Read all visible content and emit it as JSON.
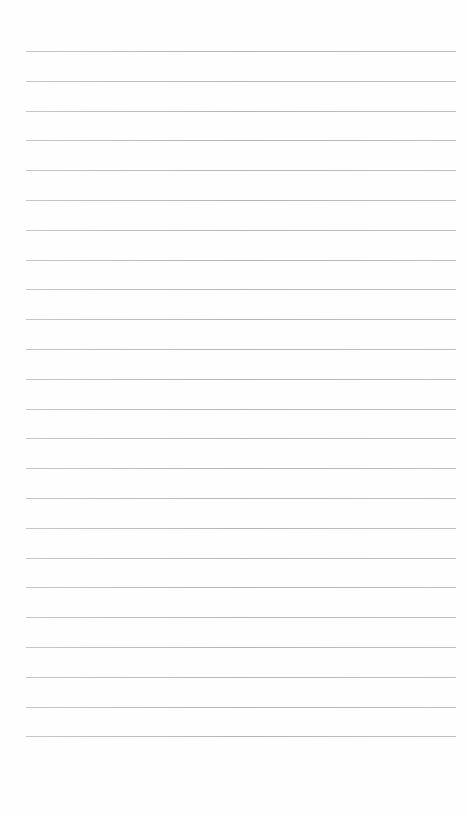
{
  "page": {
    "type": "lined-paper",
    "background_color": "#fefefe",
    "line_color": "#b0b0b0",
    "line_count": 24,
    "first_line_y": 51,
    "line_spacing": 29.8,
    "line_left": 26,
    "line_width": 430,
    "text": ""
  }
}
